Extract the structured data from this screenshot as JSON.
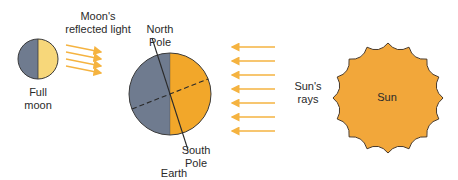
{
  "labels": {
    "moon_light": "Moon's\nreflected light",
    "full_moon": "Full\nmoon",
    "north_pole": "North\nPole",
    "south_pole": "South\nPole",
    "earth": "Earth",
    "suns_rays": "Sun's\nrays",
    "sun": "Sun"
  },
  "colors": {
    "dark_side": "#6f7b8f",
    "earth_lit": "#f2a72a",
    "moon_lit": "#f7d77a",
    "sun_fill": "#f2a73a",
    "ray": "#f5b340",
    "outline": "#3a3a3a"
  },
  "moon_arrows": 4,
  "sun_rays": 7
}
